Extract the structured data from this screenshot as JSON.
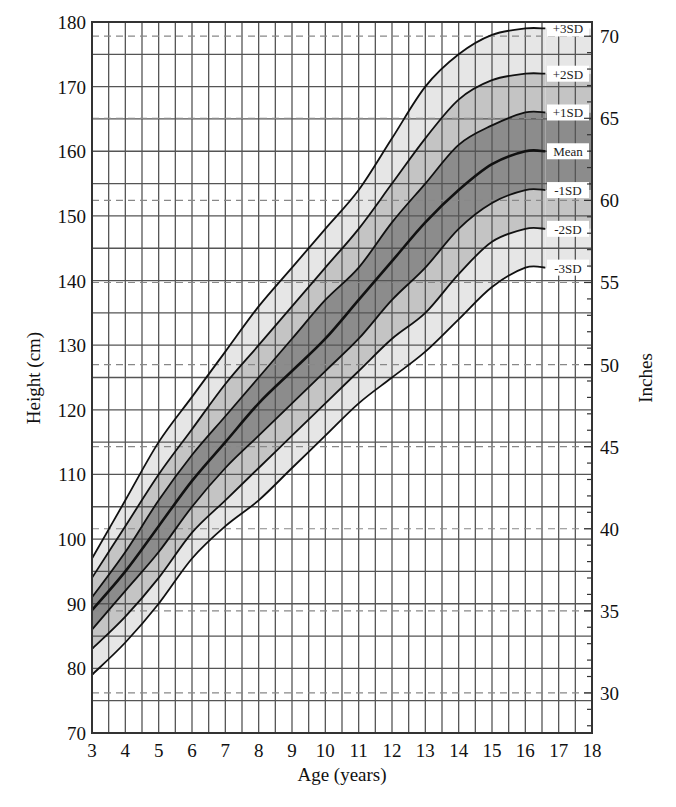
{
  "chart_data": {
    "type": "area",
    "title": "",
    "xlabel": "Age (years)",
    "ylabel": "Height (cm)",
    "ylabel_right": "Inches",
    "xlim": [
      3,
      18
    ],
    "ylim": [
      70,
      180
    ],
    "ylim_right_inches": [
      27.6,
      70.9
    ],
    "grid": true,
    "x_ticks": [
      3,
      4,
      5,
      6,
      7,
      8,
      9,
      10,
      11,
      12,
      13,
      14,
      15,
      16,
      17,
      18
    ],
    "y_ticks": [
      70,
      80,
      90,
      100,
      110,
      120,
      130,
      140,
      150,
      160,
      170,
      180
    ],
    "y_ticks_right": [
      30,
      35,
      40,
      45,
      50,
      55,
      60,
      65,
      70
    ],
    "x": [
      3,
      4,
      5,
      6,
      7,
      8,
      9,
      10,
      11,
      12,
      13,
      14,
      15,
      16,
      16.6
    ],
    "series": [
      {
        "name": "+3SD",
        "values": [
          97,
          106,
          115,
          122,
          129,
          136,
          142,
          148,
          154,
          162,
          170,
          175,
          178,
          179,
          179
        ]
      },
      {
        "name": "+2SD",
        "values": [
          94,
          102,
          110,
          117,
          124,
          130,
          136,
          142,
          148,
          155,
          162,
          168,
          171,
          172,
          172
        ]
      },
      {
        "name": "+1SD",
        "values": [
          91,
          98,
          106,
          113,
          119,
          125,
          131,
          137,
          142,
          149,
          155,
          161,
          164,
          166,
          166
        ]
      },
      {
        "name": "Mean",
        "values": [
          89,
          95,
          102,
          109,
          115,
          121,
          126,
          131,
          137,
          143,
          149,
          154,
          158,
          160,
          160
        ]
      },
      {
        "name": "-1SD",
        "values": [
          86,
          92,
          98,
          105,
          111,
          116,
          121,
          126,
          131,
          137,
          142,
          148,
          152,
          154,
          154
        ]
      },
      {
        "name": "-2SD",
        "values": [
          83,
          88,
          94,
          101,
          106,
          111,
          116,
          121,
          126,
          131,
          135,
          141,
          146,
          148,
          148
        ]
      },
      {
        "name": "-3SD",
        "values": [
          79,
          84,
          90,
          97,
          102,
          106,
          111,
          116,
          121,
          125,
          129,
          134,
          139,
          142,
          142
        ]
      }
    ],
    "band_shades": [
      "#e6e6e6",
      "#c4c4c4",
      "#8c8c8c",
      "#8c8c8c",
      "#c4c4c4",
      "#e6e6e6"
    ],
    "legend_position": "right-inline",
    "annotations": [
      "+3SD",
      "+2SD",
      "+1SD",
      "Mean",
      "-1SD",
      "-2SD",
      "-3SD"
    ]
  },
  "labels": {
    "xlabel": "Age (years)",
    "ylabel": "Height (cm)",
    "ylabel_right": "Inches"
  }
}
